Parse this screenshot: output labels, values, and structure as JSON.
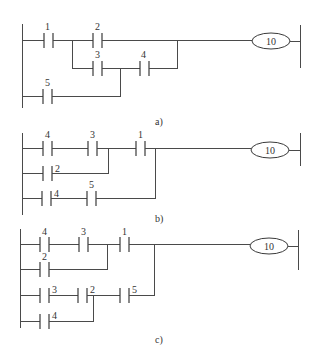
{
  "diagram": {
    "type": "ladder-logic",
    "panels": [
      {
        "caption": "a)",
        "coil": "10",
        "contacts": [
          "1",
          "2",
          "3",
          "4",
          "5"
        ],
        "logic": "(1 AND (2 OR (3 AND 4) OR ... )) — contact 1 series; branches: 2 | 3-4; 5 parallel joins between 3 and 4"
      },
      {
        "caption": "b)",
        "coil": "10",
        "contacts": [
          "4",
          "3",
          "1",
          "2",
          "4",
          "5"
        ],
        "logic": "((4 AND 3) OR 2) AND 1 OR (4 AND 5)"
      },
      {
        "caption": "c)",
        "coil": "10",
        "contacts": [
          "4",
          "3",
          "1",
          "2",
          "3",
          "2",
          "5",
          "4"
        ],
        "logic": "((4 AND 3) OR 2) AND 1 OR (((3 AND 2) OR 4) AND 5)"
      }
    ]
  },
  "labels": {
    "a": {
      "c1": "1",
      "c2": "2",
      "c3": "3",
      "c4": "4",
      "c5": "5",
      "coil": "10",
      "caption": "a)"
    },
    "b": {
      "c1": "4",
      "c2": "3",
      "c3": "1",
      "c4": "2",
      "c5": "4",
      "c6": "5",
      "coil": "10",
      "caption": "b)"
    },
    "c": {
      "c1": "4",
      "c2": "3",
      "c3": "1",
      "c4": "2",
      "c5": "3",
      "c6": "2",
      "c7": "5",
      "c8": "4",
      "coil": "10",
      "caption": "c)"
    }
  }
}
